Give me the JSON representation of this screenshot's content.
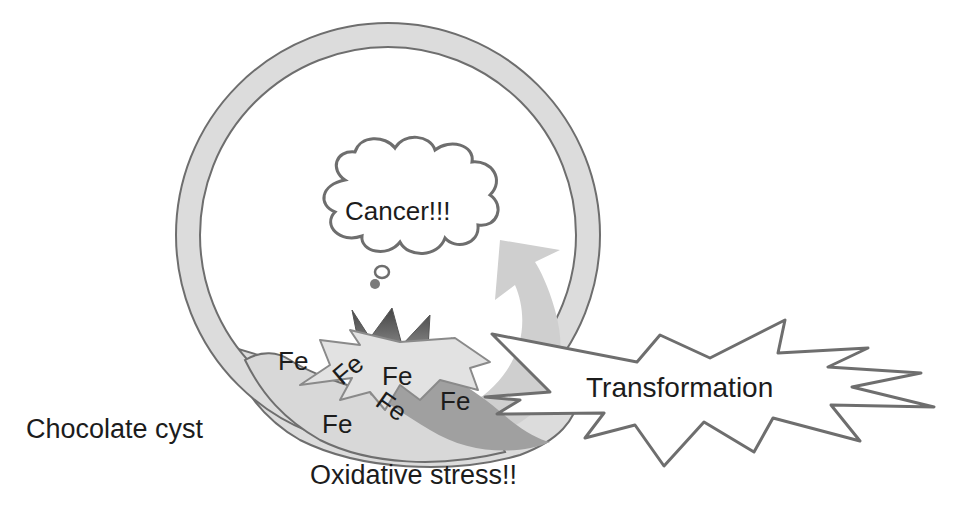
{
  "labels": {
    "cancer": "Cancer!!!",
    "transformation": "Transformation",
    "chocolate_cyst": "Chocolate cyst",
    "oxidative_stress": "Oxidative stress!!",
    "fe": [
      "Fe",
      "Fe",
      "Fe",
      "Fe",
      "Fe",
      "Fe"
    ]
  },
  "colors": {
    "outline": "#6e6e6e",
    "cyst_wall_fill": "#dcdcdc",
    "arrow_light": "#cfcfcf",
    "arrow_dark": "#9a9a9a",
    "burst_dark": "#595959",
    "text": "#1c1c1c"
  }
}
